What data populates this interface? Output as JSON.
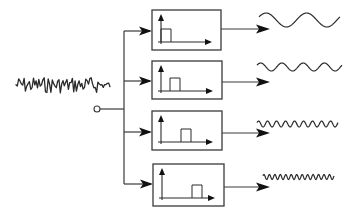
{
  "diagram": {
    "colors": {
      "stroke": "#2a2a2a",
      "background": "#ffffff",
      "arrowhead": "#111111"
    },
    "input": {
      "label": "noisy-input-signal",
      "x_start": 16,
      "x_end": 110,
      "center_y": 85,
      "amplitude": 8
    },
    "split_node": {
      "label": "split-point",
      "cx": 97,
      "cy": 109,
      "r": 3
    },
    "trunk": {
      "x": 124,
      "y_top": 31,
      "y_bottom": 184
    },
    "filters": [
      {
        "label": "band-1-low",
        "box": {
          "x": 152,
          "y": 10,
          "w": 69,
          "h": 40
        },
        "branch_y": 31,
        "pulse": {
          "x0": 161,
          "x1": 171,
          "top": 27
        },
        "output": {
          "arrow_y": 29,
          "wave": {
            "x_start": 259,
            "x_end": 340,
            "center_y": 20,
            "amplitude": 7,
            "cycles": 2
          }
        }
      },
      {
        "label": "band-2",
        "box": {
          "x": 152,
          "y": 61,
          "w": 70,
          "h": 38
        },
        "branch_y": 81,
        "pulse": {
          "x0": 170,
          "x1": 180,
          "top": 78
        },
        "output": {
          "arrow_y": 82,
          "wave": {
            "x_start": 257,
            "x_end": 342,
            "center_y": 67,
            "amplitude": 4,
            "cycles": 4
          }
        }
      },
      {
        "label": "band-3",
        "box": {
          "x": 152,
          "y": 111,
          "w": 70,
          "h": 39
        },
        "branch_y": 132,
        "pulse": {
          "x0": 181,
          "x1": 191,
          "top": 127
        },
        "output": {
          "arrow_y": 133,
          "wave": {
            "x_start": 257,
            "x_end": 338,
            "center_y": 124,
            "amplitude": 3,
            "cycles": 9
          }
        }
      },
      {
        "label": "band-4-high",
        "box": {
          "x": 153,
          "y": 164,
          "w": 71,
          "h": 42
        },
        "branch_y": 184,
        "pulse": {
          "x0": 192,
          "x1": 202,
          "top": 182
        },
        "output": {
          "arrow_y": 187,
          "wave": {
            "x_start": 263,
            "x_end": 334,
            "center_y": 177,
            "amplitude": 2.5,
            "cycles": 13
          }
        }
      }
    ]
  }
}
